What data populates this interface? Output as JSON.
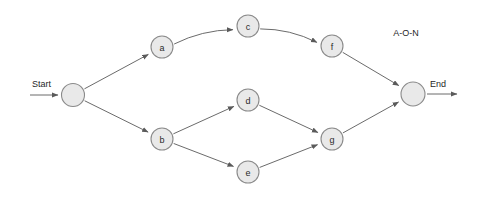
{
  "diagram": {
    "caption": "A-O-N",
    "type": "activity-on-node-network",
    "start_label": "Start",
    "end_label": "End",
    "colors": {
      "background": "#ffffff",
      "node_fill": "#e9e9e9",
      "node_stroke": "#8a8a8a",
      "edge_stroke": "#6b6b6b",
      "text": "#1f1f1f"
    },
    "nodes": [
      {
        "id": "start",
        "label": "",
        "cx": 73,
        "cy": 95,
        "r": 11.5,
        "terminal": true
      },
      {
        "id": "a",
        "label": "a",
        "cx": 162,
        "cy": 47,
        "r": 11,
        "terminal": false
      },
      {
        "id": "b",
        "label": "b",
        "cx": 162,
        "cy": 139,
        "r": 11,
        "terminal": false
      },
      {
        "id": "c",
        "label": "c",
        "cx": 248,
        "cy": 26,
        "r": 11,
        "terminal": false
      },
      {
        "id": "d",
        "label": "d",
        "cx": 248,
        "cy": 100,
        "r": 11,
        "terminal": false
      },
      {
        "id": "e",
        "label": "e",
        "cx": 248,
        "cy": 172,
        "r": 11,
        "terminal": false
      },
      {
        "id": "f",
        "label": "f",
        "cx": 332,
        "cy": 46,
        "r": 11,
        "terminal": false
      },
      {
        "id": "g",
        "label": "g",
        "cx": 332,
        "cy": 139,
        "r": 11,
        "terminal": false
      },
      {
        "id": "end",
        "label": "",
        "cx": 413,
        "cy": 94,
        "r": 12,
        "terminal": true
      }
    ],
    "edges": [
      {
        "from": "start",
        "to": "a",
        "arrow": true
      },
      {
        "from": "start",
        "to": "b",
        "arrow": true
      },
      {
        "from": "a",
        "to": "c",
        "arrow": true
      },
      {
        "from": "c",
        "to": "f",
        "arrow": true
      },
      {
        "from": "f",
        "to": "end",
        "arrow": true
      },
      {
        "from": "b",
        "to": "d",
        "arrow": true
      },
      {
        "from": "b",
        "to": "e",
        "arrow": true
      },
      {
        "from": "d",
        "to": "g",
        "arrow": true
      },
      {
        "from": "e",
        "to": "g",
        "arrow": true
      },
      {
        "from": "g",
        "to": "end",
        "arrow": true
      }
    ],
    "terminal_arrows": [
      {
        "id": "entry-arrow",
        "x1": 30,
        "y1": 95,
        "x2": 58,
        "y2": 95,
        "arrow": true
      },
      {
        "id": "exit-arrow",
        "x1": 427,
        "y1": 94,
        "x2": 457,
        "y2": 94,
        "arrow": true
      }
    ],
    "annotations": [
      {
        "id": "start-text",
        "text": "Start",
        "x": 32,
        "y": 84
      },
      {
        "id": "end-text",
        "text": "End",
        "x": 430,
        "y": 84
      },
      {
        "id": "caption-text",
        "text": "A-O-N",
        "x": 406,
        "y": 33
      }
    ]
  }
}
